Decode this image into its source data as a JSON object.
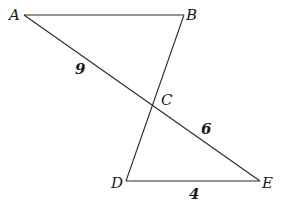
{
  "diagram": {
    "type": "geometry",
    "vertices": {
      "A": {
        "label": "A",
        "x": 24,
        "y": 15
      },
      "B": {
        "label": "B",
        "x": 184,
        "y": 15
      },
      "C": {
        "label": "C",
        "x": 153,
        "y": 104
      },
      "D": {
        "label": "D",
        "x": 126,
        "y": 181
      },
      "E": {
        "label": "E",
        "x": 260,
        "y": 181
      }
    },
    "segments": [
      {
        "from": "A",
        "to": "B"
      },
      {
        "from": "A",
        "to": "E"
      },
      {
        "from": "B",
        "to": "D"
      },
      {
        "from": "D",
        "to": "E"
      }
    ],
    "measurements": {
      "AC": "9",
      "CE": "6",
      "DE": "4"
    }
  }
}
